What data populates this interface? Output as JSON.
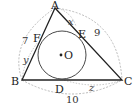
{
  "diagram": {
    "vertices": {
      "A": "A",
      "B": "B",
      "C": "C"
    },
    "tangent_points": {
      "D": "D",
      "E": "E",
      "F": "F"
    },
    "center": "O",
    "segments": {
      "x": "x",
      "y": "y",
      "z": "z"
    },
    "side_lengths": {
      "AB": "7",
      "AC": "9",
      "BC": "10"
    },
    "colors": {
      "lines": "#222222",
      "dashed": "#aaaaaa",
      "circle": "#333333"
    }
  }
}
